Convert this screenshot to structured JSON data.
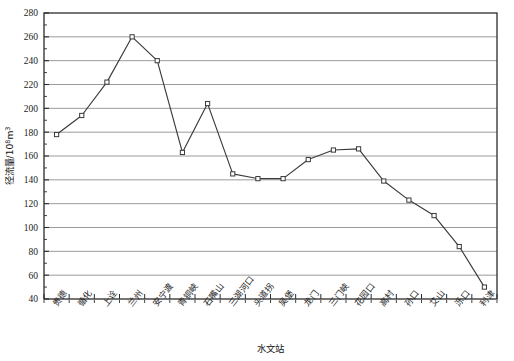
{
  "chart_data": {
    "type": "line",
    "title": "",
    "xlabel": "水文站",
    "ylabel": "径流量/10⁸m³",
    "ylabel_main": "径流量/10",
    "ylabel_sup": "8",
    "ylabel_tail": "m",
    "ylabel_tail_sup": "3",
    "ylim": [
      40,
      280
    ],
    "ytick_step": 20,
    "grid": true,
    "legend": "none",
    "marker": "open-square",
    "line_color": "#3a3a3a",
    "grid_color": "#8f8f8f",
    "axis_color": "#2b2b2b",
    "categories": [
      "贵德",
      "循化",
      "上诠",
      "兰州",
      "安宁渡",
      "青铜峡",
      "石嘴山",
      "三湖河口",
      "头道拐",
      "吴堡",
      "龙门",
      "三门峡",
      "花园口",
      "高村",
      "孙口",
      "艾山",
      "泺口",
      "利津"
    ],
    "yticks": [
      40,
      60,
      80,
      100,
      120,
      140,
      160,
      180,
      200,
      220,
      240,
      260,
      280
    ],
    "ytick_labels": [
      "40",
      "60",
      "80",
      "100",
      "120",
      "140",
      "160",
      "180",
      "200",
      "220",
      "240",
      "260",
      "280"
    ],
    "series": [
      {
        "name": "径流量",
        "values": [
          178,
          194,
          222,
          260,
          240,
          163,
          204,
          145,
          141,
          141,
          157,
          165,
          166,
          139,
          123,
          110,
          84,
          50
        ]
      }
    ],
    "points": [
      {
        "station": "贵德",
        "value": 178
      },
      {
        "station": "循化",
        "value": 194
      },
      {
        "station": "上诠",
        "value": 222
      },
      {
        "station": "兰州",
        "value": 260
      },
      {
        "station": "安宁渡",
        "value": 240
      },
      {
        "station": "青铜峡",
        "value": 163
      },
      {
        "station": "石嘴山",
        "value": 204
      },
      {
        "station": "三湖河口",
        "value": 145
      },
      {
        "station": "头道拐",
        "value": 141
      },
      {
        "station": "吴堡",
        "value": 141
      },
      {
        "station": "龙门",
        "value": 157
      },
      {
        "station": "三门峡",
        "value": 165
      },
      {
        "station": "花园口",
        "value": 166
      },
      {
        "station": "高村",
        "value": 139
      },
      {
        "station": "孙口",
        "value": 123
      },
      {
        "station": "艾山",
        "value": 110
      },
      {
        "station": "泺口",
        "value": 84
      },
      {
        "station": "利津",
        "value": 50
      }
    ]
  }
}
